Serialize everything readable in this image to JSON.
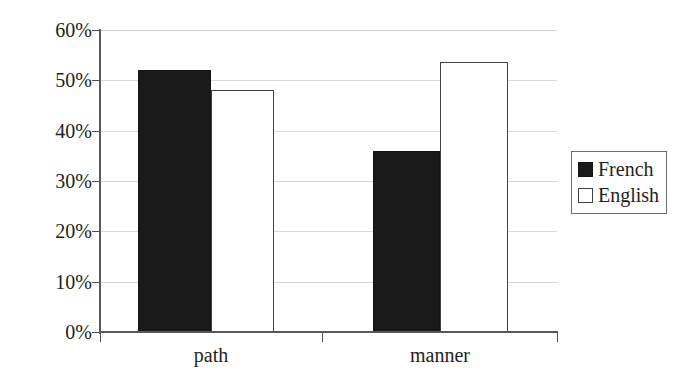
{
  "chart_data": {
    "type": "bar",
    "title": "",
    "xlabel": "",
    "ylabel": "",
    "categories": [
      "path",
      "manner"
    ],
    "series": [
      {
        "name": "French",
        "values": [
          52,
          36
        ],
        "color": "#1a1a1a",
        "style": "filled"
      },
      {
        "name": "English",
        "values": [
          48,
          53.7
        ],
        "color": "#ffffff",
        "style": "outlined"
      }
    ],
    "ylim": [
      0,
      60
    ],
    "ytick_values": [
      0,
      10,
      20,
      30,
      40,
      50,
      60
    ],
    "ytick_labels": [
      "0%",
      "10%",
      "20%",
      "30%",
      "40%",
      "50%",
      "60%"
    ],
    "grid": "horizontal",
    "legend_position": "right",
    "value_labels_shown": false
  },
  "axes": {
    "y": {
      "ticks": [
        {
          "label": "60%",
          "value": 60
        },
        {
          "label": "50%",
          "value": 50
        },
        {
          "label": "40%",
          "value": 40
        },
        {
          "label": "30%",
          "value": 30
        },
        {
          "label": "20%",
          "value": 20
        },
        {
          "label": "10%",
          "value": 10
        },
        {
          "label": "0%",
          "value": 0
        }
      ]
    },
    "x": {
      "ticks": [
        {
          "label": "path"
        },
        {
          "label": "manner"
        }
      ]
    }
  },
  "legend": {
    "entries": [
      {
        "label": "French",
        "swatch": "filled-black-square"
      },
      {
        "label": "English",
        "swatch": "open-white-square"
      }
    ]
  },
  "colors": {
    "bar_french": "#1a1a1a",
    "bar_english": "#ffffff",
    "bar_english_border": "#414042",
    "gridline": "#d9d9d9",
    "axis": "#58585a",
    "text": "#231f20",
    "background": "#ffffff"
  }
}
